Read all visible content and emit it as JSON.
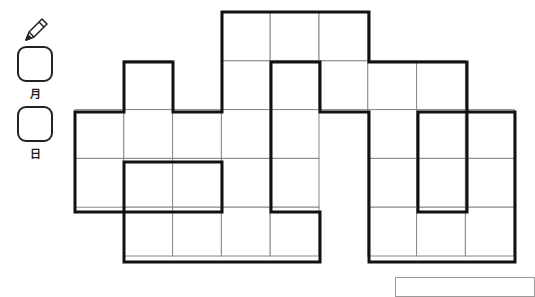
{
  "header": {
    "pencil_icon": "pencil-icon",
    "month_label": "月",
    "day_label": "日"
  },
  "puzzle": {
    "cell_size": 48.8,
    "origin": {
      "x": 75,
      "y": 12
    },
    "cols": 9,
    "rows": 5,
    "cells": [
      [
        0,
        3
      ],
      [
        0,
        4
      ],
      [
        0,
        5
      ],
      [
        1,
        1
      ],
      [
        1,
        3
      ],
      [
        1,
        4
      ],
      [
        1,
        5
      ],
      [
        1,
        6
      ],
      [
        1,
        7
      ],
      [
        2,
        0
      ],
      [
        2,
        1
      ],
      [
        2,
        2
      ],
      [
        2,
        3
      ],
      [
        2,
        4
      ],
      [
        2,
        6
      ],
      [
        2,
        7
      ],
      [
        2,
        8
      ],
      [
        3,
        0
      ],
      [
        3,
        1
      ],
      [
        3,
        2
      ],
      [
        3,
        3
      ],
      [
        3,
        4
      ],
      [
        3,
        6
      ],
      [
        3,
        7
      ],
      [
        3,
        8
      ],
      [
        4,
        1
      ],
      [
        4,
        2
      ],
      [
        4,
        3
      ],
      [
        4,
        4
      ],
      [
        4,
        6
      ],
      [
        4,
        7
      ],
      [
        4,
        8
      ]
    ],
    "thick_paths": [
      "75,112 124,112 124,62 173,62 173,112 222,112 222,12 369,12 369,62 467,62 467,112 515,112 515,262 369,262 369,112 320,112 320,62 271,62 271,212 320,212 320,262 124,262 124,212 75,212 75,112",
      "124,162 222,162 222,212 124,212 124,162",
      "418,112 467,112 467,212 418,212 418,112"
    ],
    "thin_color": "#888888",
    "thick_color": "#111111"
  }
}
